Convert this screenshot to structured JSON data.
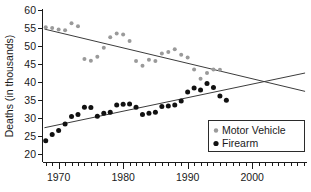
{
  "chart_data": {
    "type": "scatter",
    "title": "",
    "subtitle": "",
    "xlabel": "",
    "ylabel": "Deaths (in thousands)",
    "xlim": [
      1967.5,
      2008.5
    ],
    "ylim": [
      20,
      60
    ],
    "xticks": [
      1970,
      1980,
      1990,
      2000
    ],
    "xtick_labels": [
      "1970",
      "1980",
      "1990",
      "2000"
    ],
    "xminor_step": 1,
    "yticks": [
      20,
      25,
      30,
      35,
      40,
      45,
      50,
      55,
      60
    ],
    "ytick_labels": [
      "20",
      "25",
      "30",
      "35",
      "40",
      "45",
      "50",
      "55",
      "60"
    ],
    "grid": false,
    "legend_position": "bottom-right",
    "series": [
      {
        "name": "Motor Vehicle",
        "marker": "circle",
        "color": "#9a9a9a",
        "x": [
          1968,
          1969,
          1970,
          1971,
          1972,
          1973,
          1974,
          1975,
          1976,
          1977,
          1978,
          1979,
          1980,
          1981,
          1982,
          1983,
          1984,
          1985,
          1986,
          1987,
          1988,
          1989,
          1990,
          1991,
          1992,
          1993,
          1994,
          1995
        ],
        "y": [
          55.2,
          55.0,
          54.6,
          54.4,
          56.3,
          55.5,
          46.4,
          45.9,
          47.0,
          49.5,
          52.4,
          53.5,
          53.2,
          51.4,
          45.8,
          44.5,
          46.2,
          45.8,
          47.9,
          48.3,
          49.1,
          47.6,
          46.8,
          43.5,
          40.9,
          42.5,
          43.5,
          43.4
        ]
      },
      {
        "name": "Firearm",
        "marker": "circle",
        "color": "#111111",
        "x": [
          1968,
          1969,
          1970,
          1971,
          1972,
          1973,
          1974,
          1975,
          1976,
          1977,
          1978,
          1979,
          1980,
          1981,
          1982,
          1983,
          1984,
          1985,
          1986,
          1987,
          1988,
          1989,
          1990,
          1991,
          1992,
          1993,
          1994,
          1995,
          1996
        ],
        "y": [
          23.7,
          25.4,
          26.5,
          28.3,
          30.4,
          31.0,
          33.0,
          32.9,
          30.5,
          31.3,
          31.6,
          33.6,
          33.8,
          33.9,
          33.0,
          31.0,
          31.3,
          31.6,
          33.2,
          33.3,
          33.6,
          34.7,
          37.2,
          38.3,
          37.8,
          39.6,
          38.5,
          36.1,
          34.9
        ]
      }
    ],
    "trend_lines": [
      {
        "series": "Motor Vehicle",
        "x": [
          1967.8,
          2008.2
        ],
        "y": [
          54.7,
          37.4
        ],
        "color": "#3c3c3c"
      },
      {
        "series": "Firearm",
        "x": [
          1967.8,
          2008.2
        ],
        "y": [
          27.3,
          42.5
        ],
        "color": "#3c3c3c"
      }
    ],
    "legend": [
      {
        "label": "Motor Vehicle",
        "color": "#9a9a9a"
      },
      {
        "label": "Firearm",
        "color": "#111111"
      }
    ]
  }
}
